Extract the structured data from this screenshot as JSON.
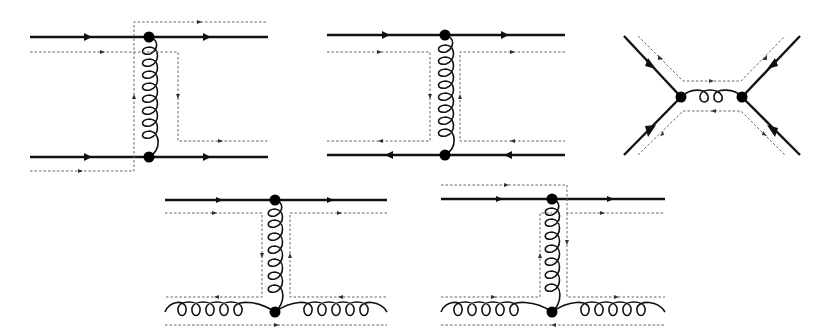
{
  "figure": {
    "colors": {
      "quark_line": "#111111",
      "color_flow": "#666666",
      "vertex": "#000000",
      "background": "#ffffff"
    },
    "diagrams": [
      {
        "id": 1,
        "type": "qq t-channel gluon exchange",
        "lines": [
          "quark",
          "quark",
          "gluon"
        ],
        "vertices": 2
      },
      {
        "id": 2,
        "type": "q qbar t-channel gluon exchange",
        "lines": [
          "quark",
          "antiquark",
          "gluon"
        ],
        "vertices": 2
      },
      {
        "id": 3,
        "type": "q qbar s-channel annihilation",
        "lines": [
          "quark",
          "antiquark",
          "gluon"
        ],
        "vertices": 2
      },
      {
        "id": 4,
        "type": "qg t-channel gluon exchange (color flow variant a)",
        "lines": [
          "quark",
          "gluon",
          "gluon"
        ],
        "vertices": 2
      },
      {
        "id": 5,
        "type": "qg t-channel gluon exchange (color flow variant b)",
        "lines": [
          "quark",
          "gluon",
          "gluon"
        ],
        "vertices": 2
      }
    ]
  }
}
